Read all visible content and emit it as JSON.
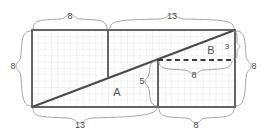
{
  "figure": {
    "colors": {
      "outline": "#555555",
      "grid": "#d8d8d8",
      "brace": "#9a9a9a",
      "label": "#4a4a4a",
      "background": "#ffffff",
      "diagonal": "#4a4a4a",
      "dashed": "#3a3a3a"
    },
    "grid": {
      "cols": 13,
      "rows": 8,
      "visible": true
    },
    "pieces": [
      {
        "name": "A",
        "label": "A"
      },
      {
        "name": "B",
        "label": "B"
      }
    ],
    "dimensions": {
      "top_left": "8",
      "top_right": "13",
      "left_side": "8",
      "right_side": "8",
      "bottom_left": "13",
      "bottom_right": "8",
      "inner_vertical": "5",
      "inner_horizontal": "8",
      "corner_small": "3"
    }
  }
}
